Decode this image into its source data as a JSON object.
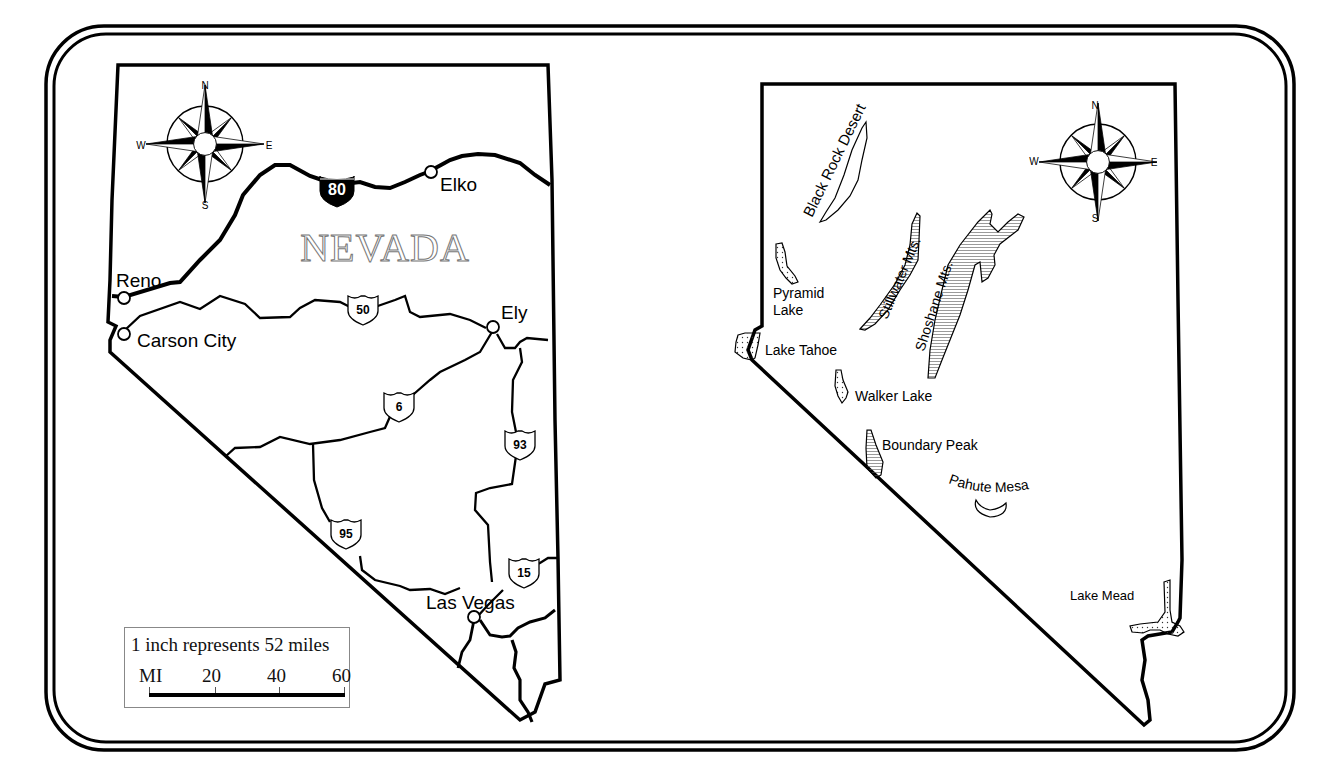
{
  "frame": {
    "border_color": "#000000",
    "background": "#ffffff"
  },
  "left_map": {
    "title": "NEVADA",
    "cities": [
      {
        "name": "Reno"
      },
      {
        "name": "Carson City"
      },
      {
        "name": "Elko"
      },
      {
        "name": "Ely"
      },
      {
        "name": "Las Vegas"
      }
    ],
    "highways": [
      {
        "type": "interstate",
        "number": "80"
      },
      {
        "type": "us",
        "number": "50"
      },
      {
        "type": "us",
        "number": "6"
      },
      {
        "type": "us",
        "number": "93"
      },
      {
        "type": "us",
        "number": "95"
      },
      {
        "type": "us",
        "number": "15"
      }
    ],
    "compass": {
      "n": "N",
      "s": "S",
      "e": "E",
      "w": "W"
    },
    "scale": {
      "title": "1 inch represents 52 miles",
      "unit": "MI",
      "ticks": [
        "20",
        "40",
        "60"
      ]
    }
  },
  "right_map": {
    "features": [
      {
        "name": "Black Rock Desert",
        "type": "desert"
      },
      {
        "name": "Pyramid",
        "name2": "Lake",
        "type": "lake"
      },
      {
        "name": "Stillwater Mts.",
        "type": "mountains"
      },
      {
        "name": "Shoshane Mts.",
        "type": "mountains"
      },
      {
        "name": "Lake Tahoe",
        "type": "lake"
      },
      {
        "name": "Walker Lake",
        "type": "lake"
      },
      {
        "name": "Boundary Peak",
        "type": "mountain"
      },
      {
        "name": "Pahute Mesa",
        "type": "mesa"
      },
      {
        "name": "Lake Mead",
        "type": "lake"
      }
    ],
    "compass": {
      "n": "N",
      "s": "S",
      "e": "E",
      "w": "W"
    }
  }
}
